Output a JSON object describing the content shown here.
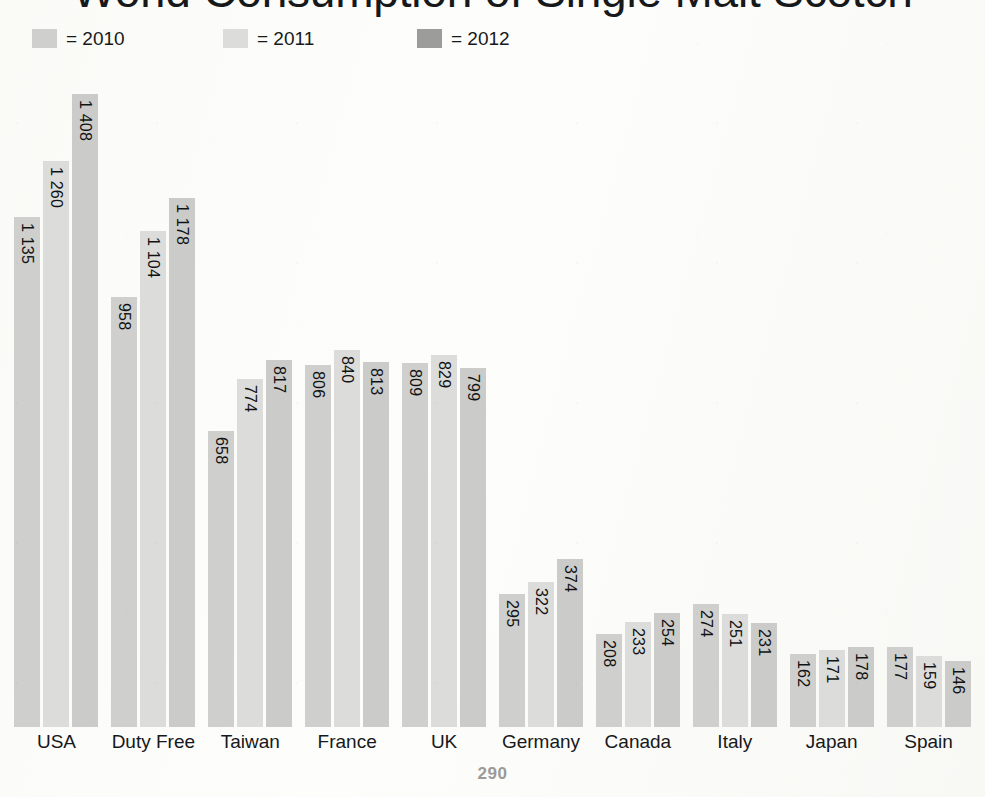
{
  "page": {
    "number": "290",
    "background_color": "#fbfbf9"
  },
  "header": {
    "title": "World Consumption of Single Malt Scotch"
  },
  "legend": {
    "position": "top-left",
    "items": [
      {
        "label": "= 2010",
        "year": "2010",
        "color": "#cfcfcd"
      },
      {
        "label": "= 2011",
        "year": "2011",
        "color": "#dcdcda"
      },
      {
        "label": "= 2012",
        "year": "2012",
        "color": "#9c9c9a"
      }
    ]
  },
  "chart_data": {
    "type": "bar",
    "title": "World Consumption of Single Malt Scotch",
    "xlabel": "",
    "ylabel": "",
    "ylim": [
      0,
      1480
    ],
    "grid": false,
    "legend_position": "top-left",
    "value_label_orientation": "vertical",
    "thousands_separator": " ",
    "categories": [
      "USA",
      "Duty Free",
      "Taiwan",
      "France",
      "UK",
      "Germany",
      "Canada",
      "Italy",
      "Japan",
      "Spain"
    ],
    "series": [
      {
        "name": "2010",
        "color": "#cfcfcd",
        "values": [
          1135,
          958,
          658,
          806,
          809,
          295,
          208,
          274,
          162,
          177
        ],
        "labels": [
          "1 135",
          "958",
          "658",
          "806",
          "809",
          "295",
          "208",
          "274",
          "162",
          "177"
        ]
      },
      {
        "name": "2011",
        "color": "#dcdcda",
        "values": [
          1260,
          1104,
          774,
          840,
          829,
          322,
          233,
          251,
          171,
          159
        ],
        "labels": [
          "1 260",
          "1 104",
          "774",
          "840",
          "829",
          "322",
          "233",
          "251",
          "171",
          "159"
        ]
      },
      {
        "name": "2012",
        "color": "#cbcbc9",
        "values": [
          1408,
          1178,
          817,
          813,
          799,
          374,
          254,
          231,
          178,
          146
        ],
        "labels": [
          "1 408",
          "1 178",
          "817",
          "813",
          "799",
          "374",
          "254",
          "231",
          "178",
          "146"
        ]
      }
    ]
  }
}
